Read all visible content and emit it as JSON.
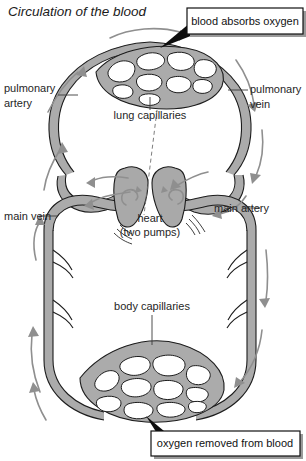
{
  "title": "Circulation of the blood",
  "callouts": [
    {
      "id": "top",
      "text": "blood absorbs oxygen"
    },
    {
      "id": "bottom",
      "text": "oxygen removed from blood"
    }
  ],
  "labels": {
    "pulmonary_artery_line1": "pulmonary",
    "pulmonary_artery_line2": "artery",
    "pulmonary_vein_line1": "pulmonary",
    "pulmonary_vein_line2": "vein",
    "lung_capillaries": "lung capillaries",
    "heart_line1": "heart",
    "heart_line2": "(two pumps)",
    "main_vein": "main vein",
    "main_artery": "main artery",
    "body_capillaries": "body capillaries"
  },
  "colors": {
    "vessel_fill": "#ababab",
    "vessel_outline": "#1c1c1c",
    "arrow": "#8f8f8f",
    "text": "#262626",
    "callout_border": "#111111",
    "callout_shadow": "#9a9a9a",
    "background": "#ffffff"
  },
  "diagram": {
    "type": "anatomical-flow-diagram",
    "regions": [
      "lung capillaries",
      "heart (two pumps)",
      "body capillaries"
    ],
    "vessels": [
      "pulmonary artery",
      "pulmonary vein",
      "main artery",
      "main vein"
    ],
    "flow_direction": "clockwise"
  }
}
